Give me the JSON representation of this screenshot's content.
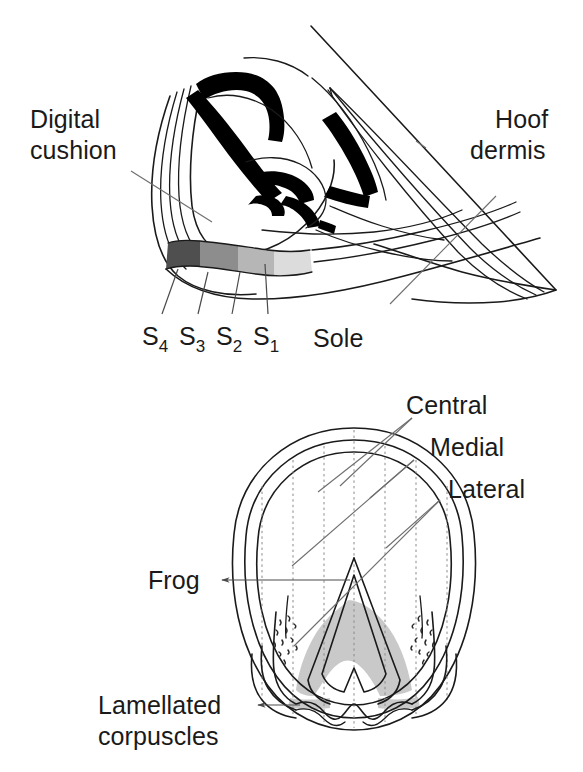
{
  "figure": {
    "background_color": "#ffffff",
    "line_color": "#1a1a1a",
    "leader_color": "#6e6e6e",
    "width": 583,
    "height": 772
  },
  "panels": {
    "top": {
      "name": "sagittal-section",
      "labels": {
        "digital_cushion_line1": "Digital",
        "digital_cushion_line2": "cushion",
        "hoof_dermis_line1": "Hoof",
        "hoof_dermis_line2": "dermis",
        "sole": "Sole"
      },
      "segment_labels": [
        {
          "id": "s4",
          "letter": "S",
          "subscript": "4",
          "shade": "#4f4f4f"
        },
        {
          "id": "s3",
          "letter": "S",
          "subscript": "3",
          "shade": "#8d8d8d"
        },
        {
          "id": "s2",
          "letter": "S",
          "subscript": "2",
          "shade": "#b6b6b6"
        },
        {
          "id": "s1",
          "letter": "S",
          "subscript": "1",
          "shade": "#dcdcdc"
        }
      ]
    },
    "bottom": {
      "name": "solar-surface",
      "labels": {
        "central": "Central",
        "medial": "Medial",
        "lateral": "Lateral",
        "frog": "Frog",
        "lamellated_line1": "Lamellated",
        "lamellated_line2": "corpuscles"
      },
      "shaded_region_color": "#c9c9c9",
      "grid_line_count": 7
    }
  },
  "colors": {
    "band_s4": "#4f4f4f",
    "band_s3": "#8d8d8d",
    "band_s2": "#b6b6b6",
    "band_s1": "#dcdcdc",
    "corpuscle_shade": "#c9c9c9",
    "ink": "#1a1a1a",
    "leader": "#6e6e6e"
  }
}
